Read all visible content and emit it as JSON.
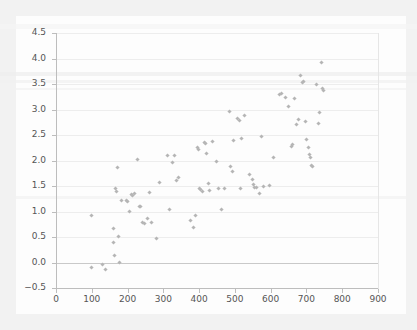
{
  "chart_data": {
    "type": "scatter",
    "title": "",
    "subtitle": "",
    "xlabel": "",
    "ylabel": "",
    "xlim": [
      0,
      900
    ],
    "ylim": [
      -0.5,
      4.5
    ],
    "grid": true,
    "legend": null,
    "legend_position": "none",
    "marker": {
      "shape": "diamond",
      "color": "#b5b5b5",
      "size": 3
    },
    "x_ticks": [
      0,
      100,
      200,
      300,
      400,
      500,
      600,
      700,
      800,
      900
    ],
    "x_tick_labels": [
      "0",
      "100",
      "200",
      "300",
      "400",
      "500",
      "600",
      "700",
      "800",
      "900"
    ],
    "y_ticks": [
      -0.5,
      0.0,
      0.5,
      1.0,
      1.5,
      2.0,
      2.5,
      3.0,
      3.5,
      4.0,
      4.5
    ],
    "y_tick_labels": [
      "-0.5",
      "0.0",
      "0.5",
      "1.0",
      "1.5",
      "2.0",
      "2.5",
      "3.0",
      "3.5",
      "4.0",
      "4.5"
    ],
    "series": [
      {
        "name": "observations",
        "points": [
          [
            99,
            0.92
          ],
          [
            99,
            -0.1
          ],
          [
            129,
            -0.04
          ],
          [
            139,
            -0.13
          ],
          [
            160,
            0.66
          ],
          [
            162,
            0.4
          ],
          [
            163,
            0.14
          ],
          [
            166,
            1.46
          ],
          [
            168,
            1.4
          ],
          [
            172,
            1.87
          ],
          [
            174,
            0.51
          ],
          [
            177,
            0.0
          ],
          [
            183,
            1.22
          ],
          [
            196,
            1.21
          ],
          [
            199,
            1.19
          ],
          [
            205,
            1.0
          ],
          [
            212,
            1.33
          ],
          [
            215,
            1.31
          ],
          [
            219,
            1.35
          ],
          [
            228,
            2.01
          ],
          [
            233,
            1.1
          ],
          [
            236,
            1.09
          ],
          [
            243,
            0.78
          ],
          [
            246,
            0.76
          ],
          [
            255,
            0.86
          ],
          [
            261,
            1.37
          ],
          [
            266,
            0.79
          ],
          [
            281,
            0.47
          ],
          [
            290,
            1.57
          ],
          [
            312,
            2.1
          ],
          [
            316,
            1.04
          ],
          [
            327,
            1.96
          ],
          [
            331,
            2.09
          ],
          [
            338,
            1.61
          ],
          [
            341,
            1.66
          ],
          [
            376,
            0.83
          ],
          [
            383,
            0.68
          ],
          [
            389,
            0.92
          ],
          [
            395,
            2.25
          ],
          [
            398,
            2.21
          ],
          [
            400,
            1.46
          ],
          [
            403,
            1.43
          ],
          [
            409,
            1.4
          ],
          [
            415,
            2.35
          ],
          [
            419,
            2.34
          ],
          [
            421,
            2.14
          ],
          [
            425,
            1.55
          ],
          [
            430,
            1.42
          ],
          [
            437,
            2.37
          ],
          [
            449,
            1.98
          ],
          [
            455,
            1.45
          ],
          [
            462,
            1.03
          ],
          [
            470,
            1.46
          ],
          [
            484,
            2.97
          ],
          [
            489,
            1.88
          ],
          [
            492,
            1.78
          ],
          [
            497,
            2.4
          ],
          [
            508,
            2.82
          ],
          [
            512,
            2.79
          ],
          [
            516,
            1.45
          ],
          [
            519,
            2.44
          ],
          [
            528,
            2.88
          ],
          [
            541,
            1.72
          ],
          [
            548,
            1.62
          ],
          [
            552,
            1.52
          ],
          [
            556,
            1.48
          ],
          [
            561,
            1.47
          ],
          [
            568,
            1.36
          ],
          [
            573,
            2.47
          ],
          [
            581,
            1.49
          ],
          [
            596,
            1.51
          ],
          [
            608,
            2.05
          ],
          [
            626,
            3.29
          ],
          [
            631,
            3.32
          ],
          [
            641,
            3.24
          ],
          [
            650,
            3.06
          ],
          [
            657,
            2.27
          ],
          [
            662,
            2.31
          ],
          [
            666,
            3.21
          ],
          [
            672,
            2.71
          ],
          [
            678,
            2.8
          ],
          [
            684,
            3.66
          ],
          [
            688,
            3.52
          ],
          [
            692,
            3.55
          ],
          [
            697,
            2.76
          ],
          [
            701,
            2.42
          ],
          [
            705,
            2.26
          ],
          [
            708,
            2.12
          ],
          [
            711,
            2.05
          ],
          [
            714,
            1.9
          ],
          [
            716,
            1.88
          ],
          [
            728,
            3.49
          ],
          [
            733,
            2.72
          ],
          [
            737,
            2.95
          ],
          [
            741,
            3.92
          ],
          [
            745,
            3.42
          ],
          [
            748,
            3.37
          ]
        ]
      }
    ],
    "point_count": 97
  }
}
